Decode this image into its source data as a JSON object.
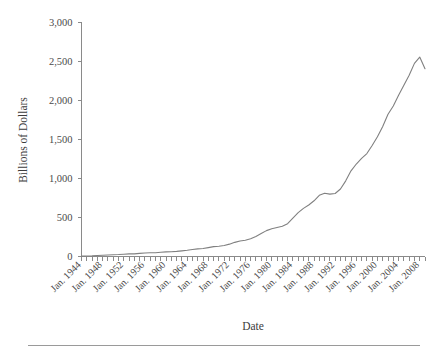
{
  "chart_data": {
    "type": "line",
    "title": "",
    "xlabel": "Date",
    "ylabel": "Billions of Dollars",
    "ylim": [
      0,
      3000
    ],
    "yticks": [
      0,
      500,
      1000,
      1500,
      2000,
      2500,
      3000
    ],
    "ytick_labels": [
      "0",
      "500",
      "1,000",
      "1,500",
      "2,000",
      "2,500",
      "3,000"
    ],
    "xlim": [
      1944,
      2009
    ],
    "xtick_labels": [
      "Jan. 1944",
      "Jan. 1948",
      "Jan. 1952",
      "Jan. 1956",
      "Jan. 1960",
      "Jan. 1964",
      "Jan. 1968",
      "Jan. 1972",
      "Jan. 1976",
      "Jan. 1980",
      "Jan. 1984",
      "Jan. 1988",
      "Jan. 1992",
      "Jan. 1996",
      "Jan. 2000",
      "Jan. 2004",
      "Jan. 2008"
    ],
    "xtick_values": [
      1944,
      1948,
      1952,
      1956,
      1960,
      1964,
      1968,
      1972,
      1976,
      1980,
      1984,
      1988,
      1992,
      1996,
      2000,
      2004,
      2008
    ],
    "minor_tick_interval": 1,
    "grid": false,
    "legend": false,
    "line_color": "#808080",
    "axis_color": "#8a8a8a",
    "x": [
      1944,
      1945,
      1946,
      1947,
      1948,
      1949,
      1950,
      1951,
      1952,
      1953,
      1954,
      1955,
      1956,
      1957,
      1958,
      1959,
      1960,
      1961,
      1962,
      1963,
      1964,
      1965,
      1966,
      1967,
      1968,
      1969,
      1970,
      1971,
      1972,
      1973,
      1974,
      1975,
      1976,
      1977,
      1978,
      1979,
      1980,
      1981,
      1982,
      1983,
      1984,
      1985,
      1986,
      1987,
      1988,
      1989,
      1990,
      1991,
      1992,
      1993,
      1994,
      1995,
      1996,
      1997,
      1998,
      1999,
      2000,
      2001,
      2002,
      2003,
      2004,
      2005,
      2006,
      2007,
      2008,
      2009
    ],
    "values": [
      5,
      6,
      8,
      12,
      16,
      19,
      23,
      25,
      29,
      33,
      34,
      40,
      45,
      48,
      48,
      55,
      59,
      60,
      65,
      72,
      80,
      90,
      98,
      103,
      114,
      126,
      132,
      140,
      158,
      181,
      199,
      207,
      226,
      255,
      293,
      331,
      356,
      371,
      387,
      420,
      492,
      561,
      616,
      659,
      713,
      783,
      809,
      798,
      806,
      863,
      968,
      1096,
      1183,
      1256,
      1317,
      1420,
      1532,
      1663,
      1819,
      1926,
      2063,
      2191,
      2319,
      2471,
      2551,
      2403
    ],
    "series_name": "Consumer Credit Outstanding"
  },
  "axis": {
    "y_title": "Billions of Dollars",
    "x_title": "Date"
  }
}
